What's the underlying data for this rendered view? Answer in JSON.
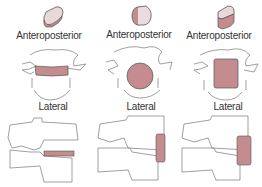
{
  "columns": [
    {
      "ap_label": "Anteroposterior",
      "lateral_label": "Lateral",
      "shape": "thin-band"
    },
    {
      "ap_label": "Anteroposterior",
      "lateral_label": "Lateral",
      "shape": "round"
    },
    {
      "ap_label": "Anteroposterior",
      "lateral_label": "Lateral",
      "shape": "rectangular"
    }
  ],
  "colors": {
    "fill": "#c48c8e",
    "fill_light": "#e3c9ca",
    "outline": "#555555",
    "bone_outline": "#888888"
  }
}
